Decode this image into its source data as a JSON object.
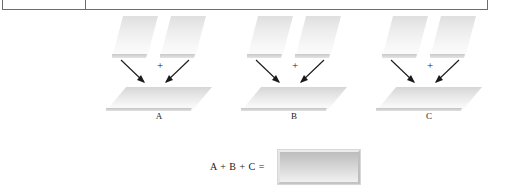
{
  "table_remnant": {
    "name": "table-bottom-edge",
    "has_column_divider": true
  },
  "diagram": {
    "title": "",
    "groups": [
      {
        "id": "A",
        "label": "A",
        "operator": "+",
        "left_operand_name": "slanted-plane-shape",
        "right_operand_name": "slanted-plane-shape",
        "result_name": "flat-plane-shape"
      },
      {
        "id": "B",
        "label": "B",
        "operator": "+",
        "left_operand_name": "slanted-plane-shape",
        "right_operand_name": "slanted-plane-shape",
        "result_name": "flat-plane-shape"
      },
      {
        "id": "C",
        "label": "C",
        "operator": "+",
        "left_operand_name": "slanted-plane-shape",
        "right_operand_name": "slanted-plane-shape",
        "result_name": "flat-plane-shape"
      }
    ],
    "summary": {
      "expression": "A + B + C =",
      "result_block_name": "solid-gray-block"
    }
  },
  "colors": {
    "shape_light": "#fcfcfc",
    "shape_mid": "#ededed",
    "shape_dark": "#d6d6d6",
    "block_dark": "#bdbdbd",
    "block_light": "#f0f0f0",
    "rule": "#6d6d6d",
    "text": "#1a1a1a"
  }
}
